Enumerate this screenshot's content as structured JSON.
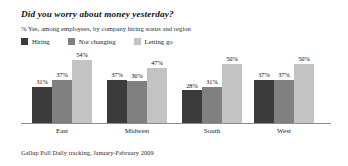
{
  "chart_data": {
    "type": "bar",
    "title": "Did you worry about money yesterday?",
    "subtitle": "% Yes, among employees, by company hiring status and region",
    "source": "Gallup Poll Daily tracking, January-February 2009",
    "xlabel": "",
    "ylabel": "",
    "ylim": [
      0,
      60
    ],
    "grid": false,
    "legend_position": "top-left",
    "categories": [
      "East",
      "Midwest",
      "South",
      "West"
    ],
    "series": [
      {
        "name": "Hiring",
        "color": "#3b3b3b",
        "values": [
          31,
          37,
          28,
          37
        ],
        "labels": [
          "31%",
          "37%",
          "28%",
          "37%"
        ]
      },
      {
        "name": "Not changing",
        "color": "#808080",
        "values": [
          37,
          36,
          31,
          37
        ],
        "labels": [
          "37%",
          "36%",
          "31%",
          "37%"
        ]
      },
      {
        "name": "Letting go",
        "color": "#c3c3c3",
        "values": [
          54,
          47,
          50,
          50
        ],
        "labels": [
          "54%",
          "47%",
          "50%",
          "50%"
        ]
      }
    ]
  }
}
